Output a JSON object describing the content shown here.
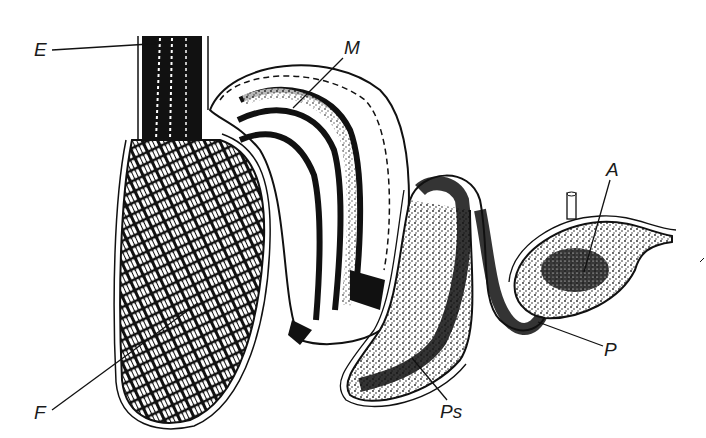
{
  "diagram": {
    "type": "anatomical-section",
    "labels": [
      {
        "id": "E",
        "text": "E",
        "x": 36,
        "y": 40
      },
      {
        "id": "M",
        "text": "M",
        "x": 344,
        "y": 38
      },
      {
        "id": "A",
        "text": "A",
        "x": 608,
        "y": 160
      },
      {
        "id": "P",
        "text": "P",
        "x": 606,
        "y": 340
      },
      {
        "id": "Ps",
        "text": "Ps",
        "x": 444,
        "y": 400
      },
      {
        "id": "F",
        "text": "F",
        "x": 36,
        "y": 403
      }
    ],
    "colors": {
      "ink": "#111111",
      "paper": "#ffffff",
      "stipple": "#2a2a2a"
    }
  }
}
